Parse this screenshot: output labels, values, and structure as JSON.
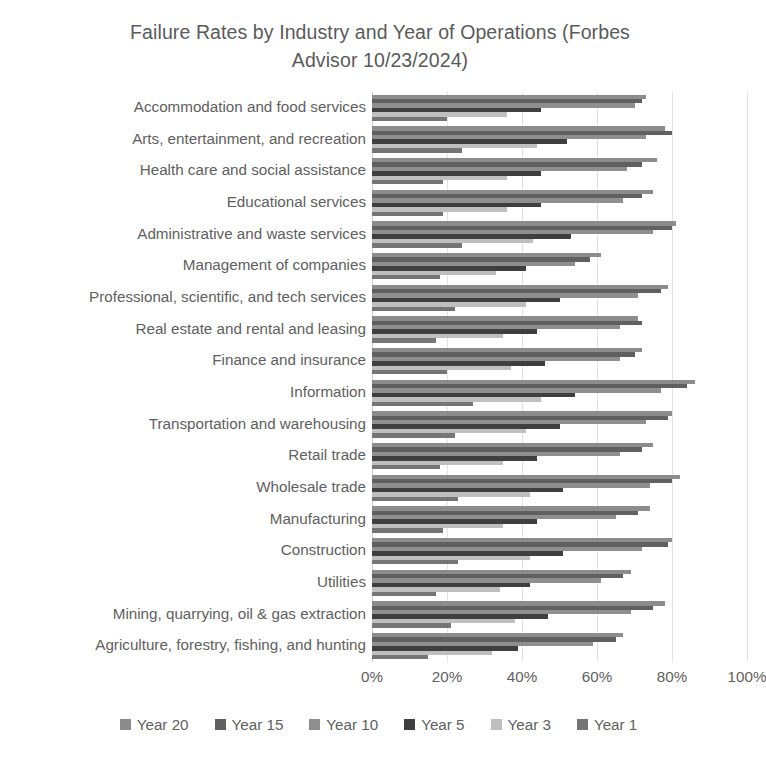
{
  "chart_data": {
    "type": "bar",
    "orientation": "horizontal",
    "title": "Failure Rates by Industry and Year of Operations (Forbes\nAdvisor 10/23/2024)",
    "xlabel": "",
    "ylabel": "",
    "xlim": [
      0,
      100
    ],
    "xticks": [
      "0%",
      "20%",
      "40%",
      "60%",
      "80%",
      "100%"
    ],
    "xtick_values": [
      0,
      20,
      40,
      60,
      80,
      100
    ],
    "grid": true,
    "legend_position": "bottom",
    "value_suffix": "%",
    "categories": [
      "Accommodation and food services",
      "Arts, entertainment, and recreation",
      "Health care and social assistance",
      "Educational services",
      "Administrative and waste services",
      "Management of companies",
      "Professional, scientific, and tech services",
      "Real estate and rental and leasing",
      "Finance and insurance",
      "Information",
      "Transportation and warehousing",
      "Retail trade",
      "Wholesale trade",
      "Manufacturing",
      "Construction",
      "Utilities",
      "Mining, quarrying, oil & gas extraction",
      "Agriculture, forestry, fishing, and hunting"
    ],
    "series": [
      {
        "name": "Year 20",
        "color": "#8c8c8c",
        "values": [
          73,
          78,
          76,
          75,
          81,
          61,
          79,
          71,
          72,
          86,
          80,
          75,
          82,
          74,
          80,
          69,
          78,
          67
        ]
      },
      {
        "name": "Year 15",
        "color": "#606060",
        "values": [
          72,
          80,
          72,
          72,
          80,
          58,
          77,
          72,
          70,
          84,
          79,
          72,
          80,
          71,
          79,
          67,
          75,
          65
        ]
      },
      {
        "name": "Year 10",
        "color": "#8f8f8f",
        "values": [
          70,
          73,
          68,
          67,
          75,
          54,
          71,
          66,
          66,
          77,
          73,
          66,
          74,
          65,
          72,
          61,
          69,
          59
        ]
      },
      {
        "name": "Year 5",
        "color": "#3f3f3f",
        "values": [
          45,
          52,
          45,
          45,
          53,
          41,
          50,
          44,
          46,
          54,
          50,
          44,
          51,
          44,
          51,
          42,
          47,
          39
        ]
      },
      {
        "name": "Year 3",
        "color": "#bfbfbf",
        "values": [
          36,
          44,
          36,
          36,
          43,
          33,
          41,
          35,
          37,
          45,
          41,
          35,
          42,
          35,
          42,
          34,
          38,
          32
        ]
      },
      {
        "name": "Year 1",
        "color": "#757575",
        "values": [
          20,
          24,
          19,
          19,
          24,
          18,
          22,
          17,
          20,
          27,
          22,
          18,
          23,
          19,
          23,
          17,
          21,
          15
        ]
      }
    ]
  }
}
